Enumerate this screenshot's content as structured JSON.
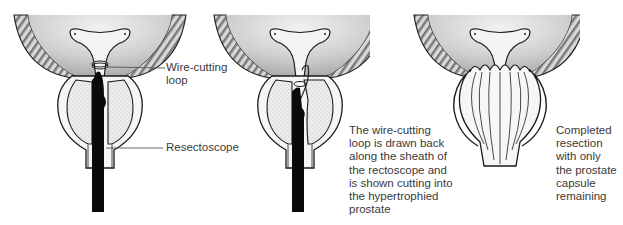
{
  "figure": {
    "panels": [
      {
        "id": "panel-1",
        "labels": [
          {
            "text": "Wire-cutting\nloop"
          },
          {
            "text": "Resectoscope"
          }
        ]
      },
      {
        "id": "panel-2",
        "caption": "The wire-cutting\nloop is drawn back\nalong the sheath of\nthe rectoscope and\nis shown cutting into\nthe hypertrophied\nprostate"
      },
      {
        "id": "panel-3",
        "caption": "Completed\nresection\nwith only\nthe prostate\ncapsule\nremaining"
      }
    ],
    "colors": {
      "ink": "#1a1a1a",
      "tissue": "#d8d8d8",
      "instrument": "#0a0a0a",
      "text": "#3a3a3a"
    }
  }
}
